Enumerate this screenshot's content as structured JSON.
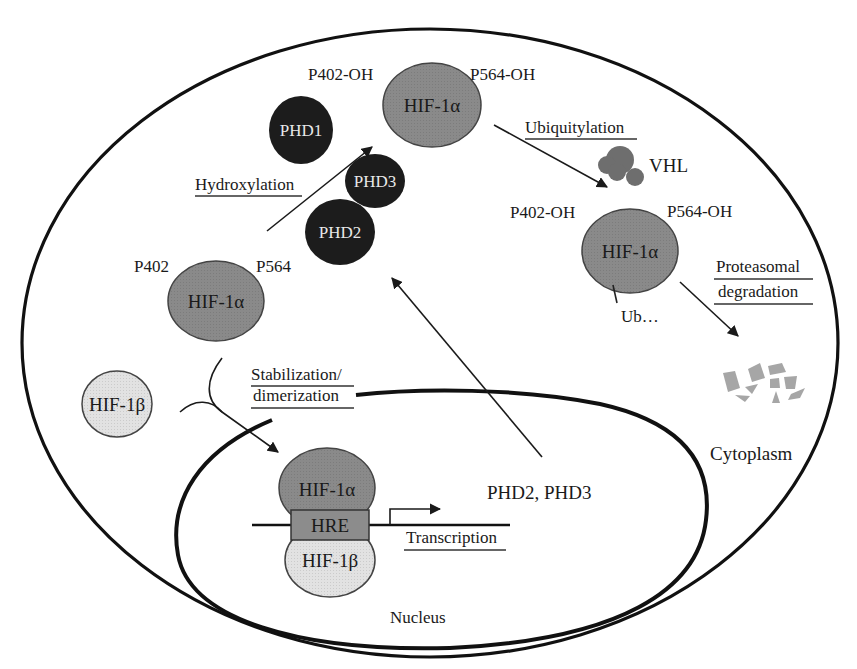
{
  "diagram": {
    "compartments": {
      "cytoplasm": "Cytoplasm",
      "nucleus": "Nucleus"
    },
    "hif_unmodified": {
      "label": "HIF-1α",
      "site_left": "P402",
      "site_right": "P564"
    },
    "hif_hydroxylated": {
      "label": "HIF-1α",
      "site_left": "P402-OH",
      "site_right": "P564-OH"
    },
    "hif_ubiquitylated": {
      "label": "HIF-1α",
      "site_left": "P402-OH",
      "site_right": "P564-OH",
      "tag": "Ub…"
    },
    "enzymes": {
      "phd1": "PHD1",
      "phd2": "PHD2",
      "phd3": "PHD3",
      "vhl": "VHL"
    },
    "hif_beta": "HIF-1β",
    "nuclear_complex": {
      "alpha": "HIF-1α",
      "element": "HRE",
      "beta": "HIF-1β"
    },
    "gene_products": "PHD2, PHD3",
    "processes": {
      "hydroxylation": "Hydroxylation",
      "ubiquitylation": "Ubiquitylation",
      "proteasomal_line1": "Proteasomal",
      "proteasomal_line2": "degradation",
      "stabilization_line1": "Stabilization/",
      "stabilization_line2": "dimerization",
      "transcription": "Transcription"
    },
    "colors": {
      "hif_alpha_fill": "#8a8a8a",
      "hif_beta_fill": "#e2e2e2",
      "phd_fill": "#1c1c1c",
      "vhl_fill": "#6e6e6e",
      "hre_fill": "#8c8c8c",
      "fragment_fill": "#a6a6a6"
    }
  }
}
